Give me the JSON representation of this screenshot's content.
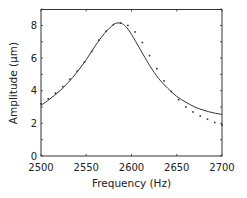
{
  "chart_data": {
    "type": "line",
    "title": "",
    "xlabel": "Frequency (Hz)",
    "ylabel": "Amplitude (μm)",
    "xlim": [
      2500,
      2700
    ],
    "ylim": [
      0,
      9
    ],
    "xticks": [
      2500,
      2550,
      2600,
      2650,
      2700
    ],
    "yticks": [
      0,
      2,
      4,
      6,
      8
    ],
    "grid": false,
    "legend": null,
    "series": [
      {
        "name": "fit",
        "style": "solid",
        "color": "#333333",
        "x": [
          2500,
          2510,
          2520,
          2530,
          2540,
          2550,
          2560,
          2570,
          2580,
          2585,
          2590,
          2595,
          2600,
          2610,
          2620,
          2630,
          2640,
          2650,
          2660,
          2670,
          2680,
          2690,
          2700
        ],
        "values": [
          3.1,
          3.5,
          3.95,
          4.5,
          5.15,
          5.9,
          6.75,
          7.5,
          8.05,
          8.15,
          8.1,
          7.85,
          7.45,
          6.5,
          5.55,
          4.75,
          4.15,
          3.65,
          3.3,
          3.0,
          2.8,
          2.65,
          2.55
        ]
      },
      {
        "name": "measured",
        "style": "dotted",
        "color": "#333333",
        "x": [
          2500,
          2508,
          2516,
          2524,
          2532,
          2540,
          2548,
          2556,
          2564,
          2572,
          2580,
          2588,
          2596,
          2604,
          2612,
          2620,
          2628,
          2636,
          2644,
          2652,
          2660,
          2668,
          2676,
          2684,
          2692,
          2700
        ],
        "values": [
          3.2,
          3.5,
          3.85,
          4.25,
          4.7,
          5.2,
          5.75,
          6.4,
          7.1,
          7.65,
          8.05,
          8.15,
          8.0,
          7.6,
          6.95,
          6.15,
          5.35,
          4.6,
          3.95,
          3.45,
          3.0,
          2.7,
          2.45,
          2.25,
          2.05,
          1.9
        ]
      }
    ]
  }
}
